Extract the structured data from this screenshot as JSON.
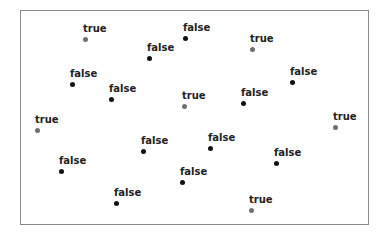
{
  "chart_data": {
    "type": "scatter",
    "title": "",
    "xlabel": "",
    "ylabel": "",
    "grid": false,
    "legend": null,
    "colors": {
      "true": "#707070",
      "false": "#111111"
    },
    "points": [
      {
        "x": 85,
        "y": 39,
        "label": "true"
      },
      {
        "x": 185,
        "y": 38,
        "label": "false"
      },
      {
        "x": 149,
        "y": 58,
        "label": "false"
      },
      {
        "x": 252,
        "y": 49,
        "label": "true"
      },
      {
        "x": 72,
        "y": 84,
        "label": "false"
      },
      {
        "x": 292,
        "y": 82,
        "label": "false"
      },
      {
        "x": 111,
        "y": 99,
        "label": "false"
      },
      {
        "x": 184,
        "y": 106,
        "label": "true"
      },
      {
        "x": 243,
        "y": 103,
        "label": "false"
      },
      {
        "x": 37,
        "y": 130,
        "label": "true"
      },
      {
        "x": 335,
        "y": 127,
        "label": "true"
      },
      {
        "x": 143,
        "y": 151,
        "label": "false"
      },
      {
        "x": 210,
        "y": 148,
        "label": "false"
      },
      {
        "x": 61,
        "y": 171,
        "label": "false"
      },
      {
        "x": 276,
        "y": 163,
        "label": "false"
      },
      {
        "x": 182,
        "y": 182,
        "label": "false"
      },
      {
        "x": 116,
        "y": 203,
        "label": "false"
      },
      {
        "x": 251,
        "y": 210,
        "label": "true"
      }
    ]
  }
}
